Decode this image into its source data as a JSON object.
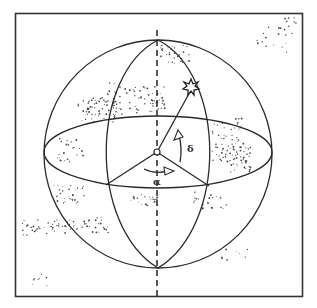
{
  "diagram": {
    "labels": {
      "right_ascension": "α",
      "declination": "δ"
    },
    "elements": [
      "frame",
      "celestial-sphere",
      "celestial-equator",
      "meridian-great-circle",
      "polar-axis",
      "observer-center",
      "star",
      "right-ascension-arrow",
      "declination-arrow"
    ],
    "colors": {
      "line": "#2a2a2a",
      "background": "#ffffff",
      "stars": "#444444"
    }
  }
}
